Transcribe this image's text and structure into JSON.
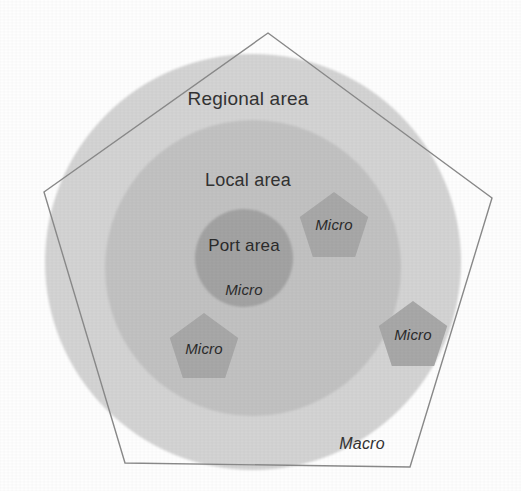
{
  "figure": {
    "width": 521,
    "height": 491,
    "background_color": "#fefefe"
  },
  "labels": {
    "regional": "Regional area",
    "local": "Local area",
    "port": "Port area",
    "macro": "Macro",
    "micro": "Micro"
  },
  "chart_data": {
    "type": "diagram",
    "title": "",
    "rings": [
      {
        "name": "Regional area",
        "label": "Regional area",
        "shape": "circle",
        "cx": 253,
        "cy": 262,
        "r": 208,
        "fill": "#d4d4d4",
        "label_x": 248,
        "label_y": 98
      },
      {
        "name": "Local area",
        "label": "Local area",
        "shape": "circle",
        "cx": 253,
        "cy": 268,
        "r": 148,
        "fill": "#c2c2c2",
        "label_x": 248,
        "label_y": 180
      },
      {
        "name": "Port area",
        "label": "Port area",
        "shape": "circle",
        "cx": 244,
        "cy": 258,
        "r": 49,
        "fill": "#a3a3a3",
        "label_x": 244,
        "label_y": 245
      }
    ],
    "outer_boundary": {
      "name": "Macro",
      "label": "Macro",
      "shape": "pentagon",
      "fill": "none",
      "stroke": "#8a8a8a",
      "stroke_width": 1.4,
      "vertices": [
        [
          268,
          33
        ],
        [
          492,
          198
        ],
        [
          410,
          467
        ],
        [
          125,
          463
        ],
        [
          44,
          192
        ]
      ],
      "label_x": 362,
      "label_y": 444
    },
    "micro_markers": [
      {
        "id": "micro-top-right",
        "label": "Micro",
        "shape": "pentagon",
        "cx": 334,
        "cy": 228,
        "r": 36,
        "fill": "#a8a8a8",
        "label_x": 334,
        "label_y": 224
      },
      {
        "id": "micro-bottom-left",
        "label": "Micro",
        "shape": "pentagon",
        "cx": 204,
        "cy": 349,
        "r": 36,
        "fill": "#a8a8a8",
        "label_x": 204,
        "label_y": 348
      },
      {
        "id": "micro-right",
        "label": "Micro",
        "shape": "pentagon",
        "cx": 413,
        "cy": 337,
        "r": 36,
        "fill": "#a8a8a8",
        "label_x": 413,
        "label_y": 334
      },
      {
        "id": "micro-port-area",
        "label": "Micro",
        "shape": "text-only",
        "cx": 244,
        "cy": 289,
        "r": 0,
        "fill": "none",
        "label_x": 244,
        "label_y": 289
      }
    ],
    "colors": {
      "regional_fill": "#d4d4d4",
      "local_fill": "#c2c2c2",
      "port_fill": "#a3a3a3",
      "micro_fill": "#a8a8a8",
      "pentagon_stroke": "#8a8a8a",
      "text": "#2f2f2f",
      "background": "#fefefe"
    }
  }
}
